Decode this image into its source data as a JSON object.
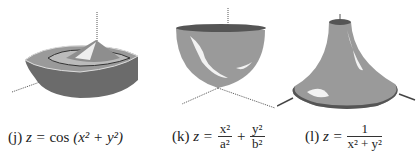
{
  "figures": [
    {
      "label": "(j)",
      "lhs": "z =",
      "func": "cos",
      "arg": "(x² + y²)"
    },
    {
      "label": "(k)",
      "lhs": "z =",
      "term1_num": "x²",
      "term1_den": "a²",
      "op": "+",
      "term2_num": "y²",
      "term2_den": "b²"
    },
    {
      "label": "(l)",
      "lhs": "z =",
      "num": "1",
      "den": "x² + y²"
    }
  ],
  "colors": {
    "surface": "#9a9a9a",
    "surface_dark": "#555555",
    "highlight": "#f2f2f2",
    "axis": "#444444"
  }
}
